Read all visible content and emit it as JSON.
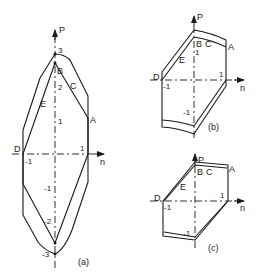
{
  "axes": {
    "vertical": "P",
    "horizontal": "n"
  },
  "points": {
    "A": "A",
    "B": "B",
    "C": "C",
    "D": "D",
    "E": "E"
  },
  "panel_a": {
    "caption": "(a)",
    "ticks_p": [
      "3",
      "2",
      "1",
      "-1",
      "-2",
      "-3"
    ],
    "ticks_n": [
      "-1",
      "1"
    ]
  },
  "panel_b": {
    "caption": "(b)",
    "ticks_p": [
      "1",
      "-1"
    ],
    "ticks_n": [
      "-1",
      "1"
    ]
  },
  "panel_c": {
    "caption": "(c)",
    "ticks_p": [
      "-1"
    ],
    "ticks_n": [
      "-1",
      "1"
    ]
  }
}
